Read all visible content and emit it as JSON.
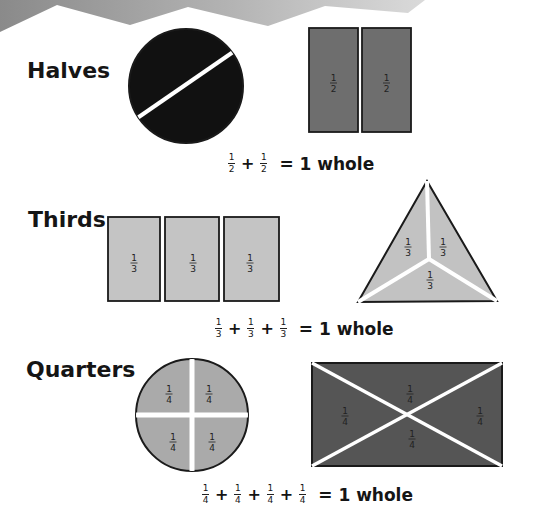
{
  "colors": {
    "background": "#ffffff",
    "zigzag_band_left": "#8a8a8a",
    "zigzag_band_right": "#d4d4d4",
    "halves_circle": "#111111",
    "halves_rects": "#6e6e6e",
    "thirds_fill": "#c2c2c2",
    "quarters_circle": "#aaaaaa",
    "quarters_rect": "#555555",
    "outline": "#1a1a1a",
    "divider": "#ffffff"
  },
  "sections": [
    {
      "id": "halves",
      "label": "Halves",
      "fraction": {
        "num": "1",
        "den": "2"
      },
      "shapes": [
        {
          "type": "circle",
          "parts": 2,
          "part_labels": []
        },
        {
          "type": "rectangle",
          "parts": 2,
          "part_labels": [
            "1/2",
            "1/2"
          ]
        }
      ],
      "equation": {
        "terms": [
          {
            "num": "1",
            "den": "2"
          },
          {
            "num": "1",
            "den": "2"
          }
        ],
        "operator": "+",
        "result": "= 1 whole"
      }
    },
    {
      "id": "thirds",
      "label": "Thirds",
      "fraction": {
        "num": "1",
        "den": "3"
      },
      "shapes": [
        {
          "type": "rectangle",
          "parts": 3,
          "part_labels": [
            "1/3",
            "1/3",
            "1/3"
          ]
        },
        {
          "type": "triangle",
          "parts": 3,
          "part_labels": [
            "1/3",
            "1/3",
            "1/3"
          ]
        }
      ],
      "equation": {
        "terms": [
          {
            "num": "1",
            "den": "3"
          },
          {
            "num": "1",
            "den": "3"
          },
          {
            "num": "1",
            "den": "3"
          }
        ],
        "operator": "+",
        "result": "= 1 whole"
      }
    },
    {
      "id": "quarters",
      "label": "Quarters",
      "fraction": {
        "num": "1",
        "den": "4"
      },
      "shapes": [
        {
          "type": "circle",
          "parts": 4,
          "part_labels": [
            "1/4",
            "1/4",
            "1/4",
            "1/4"
          ]
        },
        {
          "type": "rectangle",
          "parts": 4,
          "part_labels": [
            "1/4",
            "1/4",
            "1/4",
            "1/4"
          ]
        }
      ],
      "equation": {
        "terms": [
          {
            "num": "1",
            "den": "4"
          },
          {
            "num": "1",
            "den": "4"
          },
          {
            "num": "1",
            "den": "4"
          },
          {
            "num": "1",
            "den": "4"
          }
        ],
        "operator": "+",
        "result": "= 1 whole"
      }
    }
  ]
}
